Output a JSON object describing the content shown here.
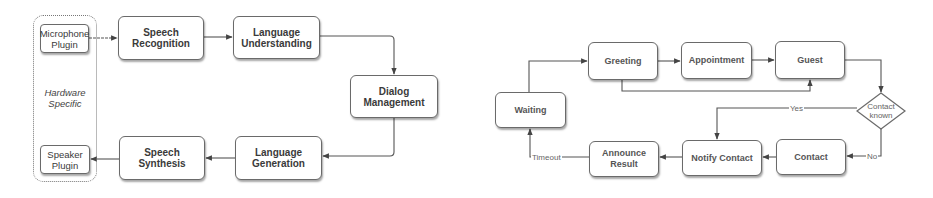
{
  "left_diagram": {
    "title": "Voice assistant pipeline",
    "group": {
      "label_line1": "Hardware",
      "label_line2": "Specific"
    },
    "nodes": {
      "microphone_plugin": {
        "line1": "Microphone",
        "line2": "Plugin"
      },
      "speech_recognition": {
        "line1": "Speech",
        "line2": "Recognition"
      },
      "language_understanding": {
        "line1": "Language",
        "line2": "Understanding"
      },
      "dialog_management": {
        "line1": "Dialog",
        "line2": "Management"
      },
      "language_generation": {
        "line1": "Language",
        "line2": "Generation"
      },
      "speech_synthesis": {
        "line1": "Speech",
        "line2": "Synthesis"
      },
      "speaker_plugin": {
        "line1": "Speaker",
        "line2": "Plugin"
      }
    },
    "edges": [
      [
        "Microphone Plugin",
        "Speech Recognition"
      ],
      [
        "Speech Recognition",
        "Language Understanding"
      ],
      [
        "Language Understanding",
        "Dialog Management"
      ],
      [
        "Dialog Management",
        "Language Generation"
      ],
      [
        "Language Generation",
        "Speech Synthesis"
      ],
      [
        "Speech Synthesis",
        "Speaker Plugin"
      ]
    ]
  },
  "right_diagram": {
    "title": "Receptionist state machine",
    "nodes": {
      "waiting": "Waiting",
      "greeting": "Greeting",
      "appointment": "Appointment",
      "guest": "Guest",
      "contact_known": {
        "line1": "Contact",
        "line2": "known"
      },
      "contact": "Contact",
      "notify_contact": "Notify Contact",
      "announce_result": "Announce Result"
    },
    "edge_labels": {
      "yes": "Yes",
      "no": "No",
      "timeout": "Timeout"
    },
    "edges": [
      [
        "Waiting",
        "Greeting",
        ""
      ],
      [
        "Greeting",
        "Appointment",
        ""
      ],
      [
        "Greeting",
        "Guest",
        ""
      ],
      [
        "Appointment",
        "Guest",
        ""
      ],
      [
        "Guest",
        "Contact known",
        ""
      ],
      [
        "Contact known",
        "Notify Contact",
        "Yes"
      ],
      [
        "Contact known",
        "Contact",
        "No"
      ],
      [
        "Contact",
        "Notify Contact",
        ""
      ],
      [
        "Notify Contact",
        "Announce Result",
        ""
      ],
      [
        "Announce Result",
        "Waiting",
        "Timeout"
      ]
    ]
  },
  "colors": {
    "stroke": "#555555",
    "node_border": "#6a6a6a",
    "background": "#ffffff",
    "text": "#3a3a3a"
  }
}
